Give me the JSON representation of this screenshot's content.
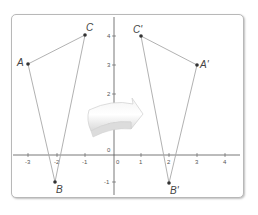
{
  "figure": {
    "x_ticks": [
      "-3",
      "-2",
      "-1",
      "0",
      "1",
      "2",
      "3",
      "4"
    ],
    "y_ticks": [
      "4",
      "3",
      "2",
      "1",
      "0",
      "-1"
    ],
    "origin_label": "0",
    "triangle_original": {
      "A": {
        "label": "A",
        "x": -3,
        "y": 3
      },
      "B": {
        "label": "B",
        "x": -2,
        "y": -1
      },
      "C": {
        "label": "C",
        "x": -1,
        "y": 4
      }
    },
    "triangle_image": {
      "A": {
        "label": "A'",
        "x": 3,
        "y": 3
      },
      "B": {
        "label": "B'",
        "x": 2,
        "y": -1
      },
      "C": {
        "label": "C'",
        "x": 1,
        "y": 4
      }
    },
    "arrow": "curved-right-arrow",
    "colors": {
      "edge": "#a8a8a8",
      "axis": "#555555",
      "point": "#333333",
      "frame": "#b8b8b8"
    }
  }
}
